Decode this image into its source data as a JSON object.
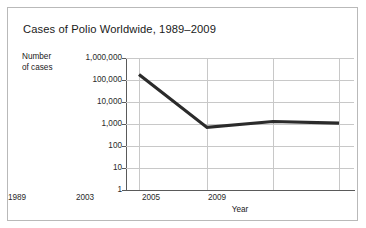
{
  "chart_data": {
    "type": "line",
    "title": "Cases of Polio Worldwide, 1989–2009",
    "xlabel": "Year",
    "ylabel": "Number of cases",
    "yscale": "log",
    "ylim": [
      1,
      1000000
    ],
    "grid": true,
    "legend": null,
    "x_tick_labels": [
      "1989",
      "2003",
      "2005",
      "2009"
    ],
    "y_tick_labels": [
      "1,000,000",
      "100,000",
      "10,000",
      "1,000",
      "100",
      "10",
      "1"
    ],
    "y_tick_values": [
      1000000,
      100000,
      10000,
      1000,
      100,
      10,
      1
    ],
    "categories": [
      "1989",
      "2003",
      "2005",
      "2009"
    ],
    "values": [
      180000,
      700,
      1300,
      1100
    ],
    "series": [
      {
        "name": "Cases of polio",
        "color": "#2b2b2b",
        "points": [
          {
            "x": "1989",
            "y": 180000
          },
          {
            "x": "2003",
            "y": 700
          },
          {
            "x": "2005",
            "y": 1300
          },
          {
            "x": "2009",
            "y": 1100
          }
        ]
      }
    ]
  },
  "figure": {
    "title": "Cases of Polio Worldwide, 1989–2009",
    "y_axis_title_line1": "Number",
    "y_axis_title_line2": "of cases",
    "x_axis_title": "Year",
    "border_color": "#b9b9b9",
    "grid_color": "#c8c8c8",
    "axis_color": "#5a5a5a",
    "line_color": "#2b2b2b",
    "background": "#ffffff"
  },
  "y_ticks": [
    {
      "label": "1,000,000"
    },
    {
      "label": "100,000"
    },
    {
      "label": "10,000"
    },
    {
      "label": "1,000"
    },
    {
      "label": "100"
    },
    {
      "label": "10"
    },
    {
      "label": "1"
    }
  ],
  "x_ticks": [
    {
      "label": "1989"
    },
    {
      "label": "2003"
    },
    {
      "label": "2005"
    },
    {
      "label": "2009"
    }
  ]
}
